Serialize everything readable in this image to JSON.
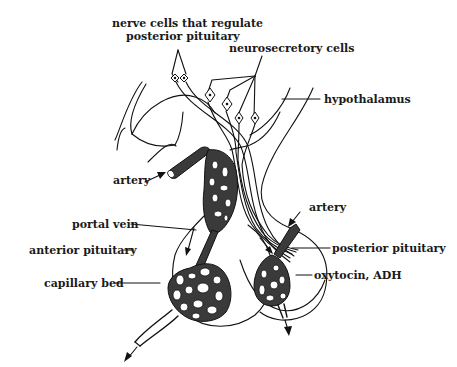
{
  "diagram": {
    "labels": {
      "nerve_cells_line1": "nerve cells that regulate",
      "nerve_cells_line2": "posterior pituitary",
      "neurosecretory_cells": "neurosecretory cells",
      "hypothalamus": "hypothalamus",
      "artery_left": "artery",
      "portal_vein": "portal vein",
      "anterior_pituitary": "anterior pituitary",
      "capillary_bed": "capillary bed",
      "artery_right": "artery",
      "posterior_pituitary": "posterior pituitary",
      "oxytocin_adh": "oxytocin, ADH"
    },
    "colors": {
      "ink": "#111111",
      "vessel_fill": "#3a3a3a",
      "background": "#ffffff"
    }
  }
}
